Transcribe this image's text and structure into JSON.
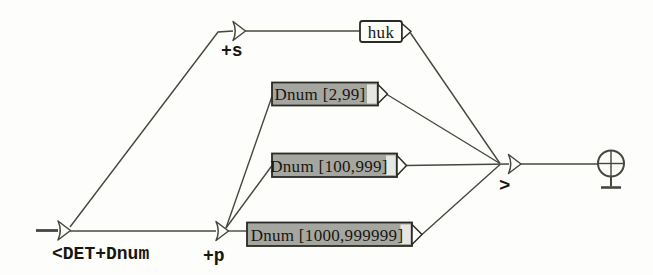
{
  "figure": {
    "type": "finite-state-graph",
    "colors": {
      "background": "#fdfdfb",
      "line": "#47473f",
      "box_fill": "#a6a6a1",
      "box_band": "#e7e7e2",
      "box_stroke": "#2b2b25",
      "node_fill": "#fcfcf9",
      "text": "#17170f"
    },
    "start": {
      "label": "<DET+Dnum"
    },
    "nodes": [
      {
        "id": "plus-s",
        "label": "+s"
      },
      {
        "id": "plus-p",
        "label": "+p"
      },
      {
        "id": "output",
        "label": ">"
      }
    ],
    "boxes": [
      {
        "id": "huk",
        "label": "huk",
        "style": "white"
      },
      {
        "id": "dnum-small",
        "label": "Dnum [2,99]",
        "style": "gray"
      },
      {
        "id": "dnum-medium",
        "label": "Dnum [100,999]",
        "style": "gray"
      },
      {
        "id": "dnum-large",
        "label": "Dnum [1000,999999]",
        "style": "gray"
      }
    ]
  }
}
